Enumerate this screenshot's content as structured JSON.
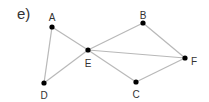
{
  "panel_label": "e)",
  "graph": {
    "edge_color": "#b8b8b8",
    "node_color": "#000000",
    "nodes": [
      {
        "id": "A",
        "label": "A",
        "x": 52,
        "y": 27,
        "lx": 52,
        "ly": 18
      },
      {
        "id": "B",
        "label": "B",
        "x": 143,
        "y": 23,
        "lx": 143,
        "ly": 16
      },
      {
        "id": "C",
        "label": "C",
        "x": 136,
        "y": 82,
        "lx": 136,
        "ly": 95
      },
      {
        "id": "D",
        "label": "D",
        "x": 44,
        "y": 83,
        "lx": 44,
        "ly": 96
      },
      {
        "id": "E",
        "label": "E",
        "x": 88,
        "y": 50,
        "lx": 88,
        "ly": 64
      },
      {
        "id": "F",
        "label": "F",
        "x": 185,
        "y": 58,
        "lx": 194,
        "ly": 62
      }
    ],
    "edges": [
      [
        "A",
        "D"
      ],
      [
        "A",
        "E"
      ],
      [
        "D",
        "E"
      ],
      [
        "E",
        "B"
      ],
      [
        "E",
        "F"
      ],
      [
        "E",
        "C"
      ],
      [
        "B",
        "F"
      ],
      [
        "C",
        "F"
      ]
    ]
  }
}
